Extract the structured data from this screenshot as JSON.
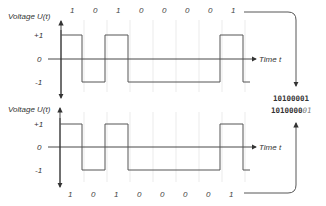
{
  "diagram": {
    "top_chart": {
      "y_axis_label": "Voltage U(t)",
      "x_axis_label": "Time t",
      "y_ticks": [
        "+1",
        "0",
        "-1"
      ],
      "bits": [
        "1",
        "0",
        "1",
        "0",
        "0",
        "0",
        "0",
        "1"
      ]
    },
    "bottom_chart": {
      "y_axis_label": "Voltage U(t)",
      "x_axis_label": "Time t",
      "y_ticks": [
        "+1",
        "0",
        "-1"
      ],
      "bits": [
        "1",
        "0",
        "1",
        "0",
        "0",
        "0",
        "0",
        "1"
      ]
    },
    "output": {
      "line1": "10100001",
      "line2_main": "1010000",
      "line2_italic": "01"
    },
    "colors": {
      "line": "#444444",
      "grid": "#e4e4e4",
      "text": "#333333"
    }
  }
}
